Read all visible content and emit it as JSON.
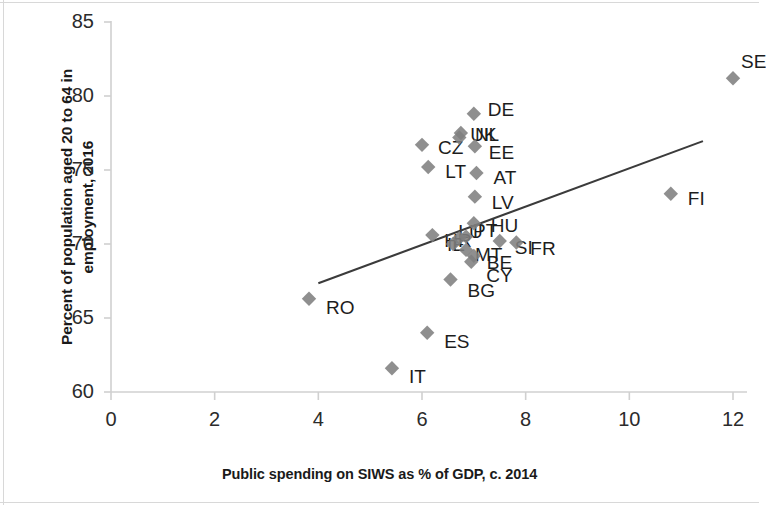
{
  "chart_data": {
    "type": "scatter",
    "title": "",
    "xlabel": "Public spending on SIWS as % of GDP, c. 2014",
    "ylabel": "Percent of population aged 20 to 64 in employment, 2016",
    "ylabel_line1": "Percent of population aged 20 to 64 in",
    "ylabel_line2": "employment, 2016",
    "xlim": [
      0,
      12
    ],
    "ylim": [
      60,
      85
    ],
    "xticks": [
      0,
      2,
      4,
      6,
      8,
      10,
      12
    ],
    "yticks": [
      60,
      65,
      70,
      75,
      80,
      85
    ],
    "grid": false,
    "legend": "none",
    "marker": "diamond",
    "marker_color": "#7f7f7f",
    "line_color": "#3b3b3b",
    "axis_color": "#d0d0d0",
    "points": [
      {
        "label": "SE",
        "x": 12.0,
        "y": 81.2,
        "lx": 8,
        "ly": -26
      },
      {
        "label": "DE",
        "x": 7.0,
        "y": 78.8,
        "lx": 14,
        "ly": -14
      },
      {
        "label": "NL",
        "x": 6.75,
        "y": 77.5,
        "lx": 14,
        "ly": -8
      },
      {
        "label": "UK",
        "x": 6.72,
        "y": 77.2,
        "lx": 11,
        "ly": -12
      },
      {
        "label": "EE",
        "x": 7.02,
        "y": 76.6,
        "lx": 14,
        "ly": -3
      },
      {
        "label": "CZ",
        "x": 6.0,
        "y": 76.7,
        "lx": 16,
        "ly": -7
      },
      {
        "label": "LT",
        "x": 6.12,
        "y": 75.2,
        "lx": 17,
        "ly": -5
      },
      {
        "label": "AT",
        "x": 7.05,
        "y": 74.8,
        "lx": 17,
        "ly": -5
      },
      {
        "label": "LV",
        "x": 7.02,
        "y": 73.2,
        "lx": 17,
        "ly": -4
      },
      {
        "label": "FI",
        "x": 10.8,
        "y": 73.4,
        "lx": 17,
        "ly": -5
      },
      {
        "label": "HU",
        "x": 7.0,
        "y": 71.4,
        "lx": 17,
        "ly": -7
      },
      {
        "label": "SI",
        "x": 7.5,
        "y": 70.2,
        "lx": 15,
        "ly": -3
      },
      {
        "label": "FR",
        "x": 7.82,
        "y": 70.1,
        "lx": 14,
        "ly": -4
      },
      {
        "label": "PT",
        "x": 6.85,
        "y": 70.5,
        "lx": 7,
        "ly": -16
      },
      {
        "label": "LU",
        "x": 6.72,
        "y": 70.4,
        "lx": -1,
        "ly": -16
      },
      {
        "label": "IE",
        "x": 6.6,
        "y": 70.0,
        "lx": -6,
        "ly": -9
      },
      {
        "label": "HR",
        "x": 6.2,
        "y": 70.6,
        "lx": 12,
        "ly": -4
      },
      {
        "label": "MT",
        "x": 6.85,
        "y": 69.6,
        "lx": 9,
        "ly": -5
      },
      {
        "label": "BE",
        "x": 7.0,
        "y": 69.2,
        "lx": 13,
        "ly": -3
      },
      {
        "label": "CY",
        "x": 6.95,
        "y": 68.8,
        "lx": 15,
        "ly": 4
      },
      {
        "label": "BG",
        "x": 6.55,
        "y": 67.6,
        "lx": 17,
        "ly": 1
      },
      {
        "label": "RO",
        "x": 3.82,
        "y": 66.3,
        "lx": 17,
        "ly": -1
      },
      {
        "label": "ES",
        "x": 6.1,
        "y": 64.0,
        "lx": 17,
        "ly": -1
      },
      {
        "label": "IT",
        "x": 5.42,
        "y": 61.6,
        "lx": 17,
        "ly": -1
      }
    ],
    "trendline": {
      "x0": 4.0,
      "y0": 67.35,
      "x1": 11.42,
      "y1": 76.95
    }
  }
}
